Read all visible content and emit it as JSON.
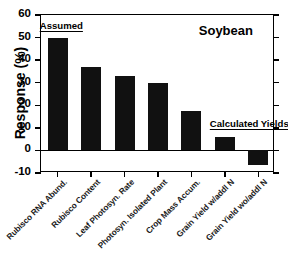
{
  "chart_data": {
    "type": "bar",
    "title": "Soybean",
    "xlabel": "",
    "ylabel": "Response (%)",
    "ylim": [
      -10,
      60
    ],
    "yticks": [
      60,
      50,
      40,
      30,
      20,
      10,
      0,
      -10
    ],
    "grid": false,
    "legend": "none",
    "bar_color": "#111111",
    "categories": [
      "Rubisco RNA Abund.",
      "Rubisco Content",
      "Leaf Photosyn. Rate",
      "Photosyn. Isolated Plant",
      "Crop Mass Accum.",
      "Grain Yield w/addl N",
      "Grain Yield wo/addl N"
    ],
    "values": [
      50,
      37,
      33,
      30,
      17.5,
      6,
      -6.5
    ],
    "annotations": [
      {
        "text": "Assumed",
        "underlined": true
      },
      {
        "text": "Calculated Yields",
        "underlined": true
      }
    ]
  },
  "figure": {
    "plot_title": "Soybean",
    "y_axis_title": "Response (%)",
    "y_tick_labels": [
      "60",
      "50",
      "40",
      "30",
      "20",
      "10",
      "0",
      "-10"
    ],
    "annotation_assumed": "Assumed",
    "annotation_calculated": "Calculated Yields",
    "bottom_caption": ""
  }
}
